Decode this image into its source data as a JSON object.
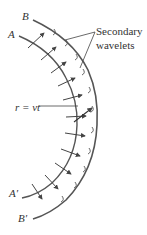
{
  "figure": {
    "labels": {
      "outer_start": "B",
      "inner_start": "A",
      "inner_end": "A′",
      "outer_end": "B′",
      "wavelets_line1": "Secondary",
      "wavelets_line2": "wavelets",
      "radius": "r = vt"
    },
    "colors": {
      "stroke": "#555555",
      "text": "#333333",
      "background": "#ffffff"
    },
    "arcs": {
      "inner_wavefront": {
        "name": "AA′",
        "rightmost_x": 77
      },
      "outer_wavefront": {
        "name": "BB′",
        "rightmost_x": 97
      }
    },
    "ray_count": 11
  }
}
